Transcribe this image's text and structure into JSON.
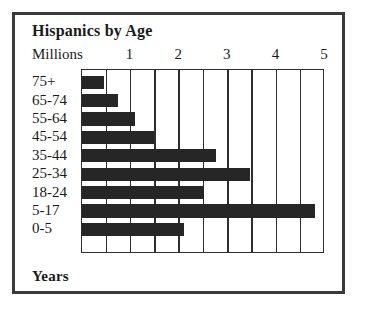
{
  "chart_data": {
    "type": "bar",
    "orientation": "horizontal",
    "title": "Hispanics by Age",
    "xlabel": "Millions",
    "ylabel": "Years",
    "categories": [
      "75+",
      "65-74",
      "55-64",
      "45-54",
      "35-44",
      "25-34",
      "18-24",
      "5-17",
      "0-5"
    ],
    "values": [
      0.45,
      0.74,
      1.1,
      1.48,
      2.75,
      3.45,
      2.5,
      4.8,
      2.1
    ],
    "xlim": [
      0,
      5
    ],
    "xticks": [
      1,
      2,
      3,
      4,
      5
    ],
    "xticklabels": [
      "1",
      "2",
      "3",
      "4",
      "5"
    ],
    "minor_gridline_step": 0.5,
    "grid": true,
    "legend": null,
    "bar_color": "#262626",
    "border_color": "#3a3a3a",
    "background_color": "#ffffff"
  },
  "figure": {
    "title": "Hispanics by Age",
    "unit_label": "Millions",
    "axis_label": "Years"
  }
}
